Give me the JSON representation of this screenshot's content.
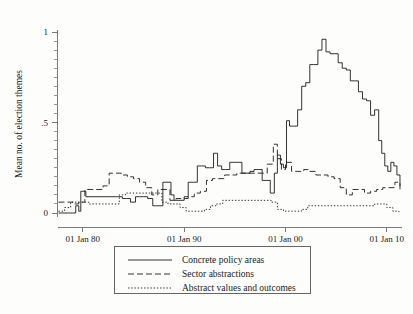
{
  "figure": {
    "background_color": "#fdfdfc",
    "line_color": "#1c1c1c",
    "axis_color": "#7a7a7a"
  },
  "axes": {
    "ylabel": "Mean no. of election themes",
    "xlabel": "",
    "y_ticks": [
      "0",
      ".5",
      "1"
    ],
    "y_tick_values": [
      0,
      0.5,
      1
    ],
    "x_ticks": [
      "01 Jan 80",
      "01 Jan 90",
      "01 Jan 00",
      "01 Jan 10"
    ],
    "x_tick_values": [
      1980,
      1990,
      2000,
      2010
    ],
    "ylim": [
      0,
      1
    ],
    "xlim": [
      1977.5,
      2011.5
    ],
    "grid": "none",
    "minor_ticks": "y-axis only"
  },
  "legend": {
    "position": "below-axes",
    "entries": [
      {
        "label": "Concrete policy areas",
        "style": "solid",
        "dash": "none"
      },
      {
        "label": "Sector abstractions",
        "style": "dashed",
        "dash": "6,3"
      },
      {
        "label": "Abstract values and outcomes",
        "style": "dotted",
        "dash": "1.4,1.8"
      }
    ]
  },
  "chart_data": {
    "type": "line",
    "title": "",
    "xlabel": "",
    "ylabel": "Mean no. of election themes",
    "xlim": [
      1977.5,
      2011.5
    ],
    "ylim": [
      0,
      1
    ],
    "grid": false,
    "legend_position": "below",
    "x_tick_labels": [
      "01 Jan 80",
      "01 Jan 90",
      "01 Jan 00",
      "01 Jan 10"
    ],
    "y_tick_labels": [
      "0",
      ".5",
      "1"
    ],
    "series": [
      {
        "name": "Concrete policy areas",
        "style": "solid",
        "x": [
          1977.6,
          1978.6,
          1979.0,
          1979.3,
          1979.6,
          1979.8,
          1980.0,
          1980.3,
          1980.6,
          1981.4,
          1982.6,
          1983.4,
          1983.9,
          1984.3,
          1984.7,
          1985.2,
          1985.6,
          1986.0,
          1986.4,
          1986.9,
          1987.2,
          1987.5,
          1987.9,
          1988.3,
          1988.7,
          1989.0,
          1989.3,
          1989.6,
          1990.0,
          1990.4,
          1990.9,
          1991.3,
          1991.7,
          1992.1,
          1992.5,
          1992.9,
          1993.3,
          1993.7,
          1994.1,
          1994.5,
          1994.9,
          1995.3,
          1995.7,
          1996.1,
          1996.5,
          1996.9,
          1997.3,
          1997.7,
          1998.1,
          1998.5,
          1998.9,
          1999.2,
          1999.5,
          1999.8,
          2000.1,
          2000.4,
          2000.8,
          2001.2,
          2001.6,
          2002.0,
          2002.4,
          2002.8,
          2003.2,
          2003.6,
          2004.0,
          2004.4,
          2004.8,
          2005.2,
          2005.6,
          2006.0,
          2006.4,
          2006.8,
          2007.2,
          2007.6,
          2008.0,
          2008.4,
          2008.8,
          2009.2,
          2009.5,
          2009.8,
          2010.1,
          2010.4,
          2010.7,
          2011.0,
          2011.3
        ],
        "y": [
          0.0,
          0.0,
          0.0,
          0.04,
          0.01,
          0.12,
          0.12,
          0.09,
          0.09,
          0.09,
          0.09,
          0.09,
          0.08,
          0.08,
          0.06,
          0.09,
          0.09,
          0.09,
          0.08,
          0.04,
          0.04,
          0.04,
          0.17,
          0.17,
          0.1,
          0.07,
          0.07,
          0.07,
          0.09,
          0.17,
          0.17,
          0.26,
          0.26,
          0.25,
          0.25,
          0.33,
          0.26,
          0.24,
          0.24,
          0.28,
          0.28,
          0.28,
          0.22,
          0.22,
          0.23,
          0.24,
          0.24,
          0.18,
          0.18,
          0.11,
          0.22,
          0.32,
          0.27,
          0.25,
          0.51,
          0.48,
          0.48,
          0.57,
          0.7,
          0.72,
          0.82,
          0.82,
          0.9,
          0.96,
          0.89,
          0.88,
          0.88,
          0.83,
          0.8,
          0.79,
          0.73,
          0.73,
          0.67,
          0.63,
          0.62,
          0.54,
          0.57,
          0.4,
          0.33,
          0.26,
          0.23,
          0.28,
          0.26,
          0.21,
          0.15
        ]
      },
      {
        "name": "Sector abstractions",
        "style": "dashed",
        "x": [
          1977.6,
          1978.4,
          1979.0,
          1979.6,
          1980.2,
          1980.8,
          1981.4,
          1982.0,
          1982.6,
          1983.2,
          1983.8,
          1984.4,
          1985.0,
          1985.6,
          1986.2,
          1986.8,
          1987.4,
          1988.0,
          1988.6,
          1989.2,
          1989.8,
          1990.4,
          1991.0,
          1991.6,
          1992.2,
          1992.8,
          1993.4,
          1994.0,
          1994.6,
          1995.2,
          1995.8,
          1996.4,
          1997.0,
          1997.6,
          1998.2,
          1998.8,
          1999.2,
          1999.6,
          2000.0,
          2000.6,
          2001.2,
          2001.8,
          2002.4,
          2003.0,
          2003.6,
          2004.2,
          2004.8,
          2005.4,
          2006.0,
          2006.6,
          2007.2,
          2007.8,
          2008.4,
          2009.0,
          2009.6,
          2010.2,
          2010.8,
          2011.3
        ],
        "y": [
          0.06,
          0.06,
          0.05,
          0.06,
          0.13,
          0.13,
          0.13,
          0.15,
          0.22,
          0.22,
          0.21,
          0.2,
          0.19,
          0.17,
          0.14,
          0.1,
          0.13,
          0.13,
          0.07,
          0.08,
          0.08,
          0.09,
          0.11,
          0.12,
          0.18,
          0.19,
          0.19,
          0.21,
          0.21,
          0.22,
          0.22,
          0.22,
          0.22,
          0.22,
          0.27,
          0.38,
          0.3,
          0.24,
          0.28,
          0.23,
          0.23,
          0.24,
          0.23,
          0.21,
          0.21,
          0.2,
          0.19,
          0.14,
          0.1,
          0.13,
          0.13,
          0.11,
          0.12,
          0.13,
          0.14,
          0.14,
          0.17,
          0.13
        ]
      },
      {
        "name": "Abstract values and outcomes",
        "style": "dotted",
        "x": [
          1977.6,
          1978.2,
          1978.8,
          1979.4,
          1980.0,
          1980.6,
          1981.2,
          1981.8,
          1982.4,
          1983.0,
          1983.6,
          1984.2,
          1984.8,
          1985.4,
          1986.0,
          1986.6,
          1987.2,
          1987.8,
          1988.4,
          1989.0,
          1989.6,
          1990.2,
          1990.8,
          1991.4,
          1992.0,
          1992.6,
          1993.2,
          1993.8,
          1994.4,
          1995.0,
          1995.6,
          1996.2,
          1996.8,
          1997.4,
          1998.0,
          1998.6,
          1999.2,
          1999.8,
          2000.4,
          2001.0,
          2001.6,
          2002.2,
          2002.8,
          2003.4,
          2004.0,
          2004.6,
          2005.2,
          2005.8,
          2006.4,
          2007.0,
          2007.6,
          2008.2,
          2008.8,
          2009.4,
          2010.0,
          2010.6,
          2011.2
        ],
        "y": [
          0.01,
          0.03,
          0.06,
          0.06,
          0.06,
          0.05,
          0.05,
          0.05,
          0.05,
          0.05,
          0.1,
          0.11,
          0.11,
          0.11,
          0.11,
          0.11,
          0.11,
          0.06,
          0.05,
          0.05,
          0.03,
          0.01,
          0.01,
          0.01,
          0.02,
          0.04,
          0.05,
          0.07,
          0.07,
          0.07,
          0.07,
          0.07,
          0.07,
          0.07,
          0.07,
          0.06,
          0.02,
          0.01,
          0.01,
          0.01,
          0.02,
          0.04,
          0.04,
          0.04,
          0.04,
          0.04,
          0.04,
          0.04,
          0.04,
          0.04,
          0.04,
          0.04,
          0.05,
          0.05,
          0.03,
          0.01,
          0.0
        ]
      }
    ]
  }
}
